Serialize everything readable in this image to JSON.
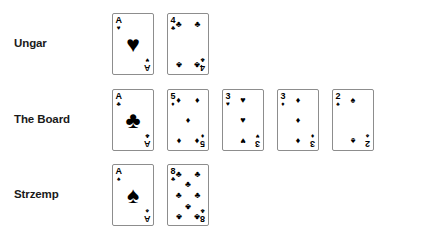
{
  "diagram": {
    "suit_glyphs": {
      "spade": "♠",
      "heart": "♥",
      "diamond": "♦",
      "club": "♣"
    },
    "card_back_color": "#ffffff",
    "card_border_color": "#8d8d8d",
    "ink_color": "#000000",
    "label_color": "#1a1a1a",
    "background_color": "#ffffff"
  },
  "rows": [
    {
      "label": "Ungar",
      "cards": [
        {
          "rank": "A",
          "suit": "heart",
          "suit_glyph": "♥",
          "name": "ace-of-hearts"
        },
        {
          "rank": "4",
          "suit": "club",
          "suit_glyph": "♣",
          "name": "four-of-clubs"
        }
      ]
    },
    {
      "label": "The Board",
      "cards": [
        {
          "rank": "A",
          "suit": "club",
          "suit_glyph": "♣",
          "name": "ace-of-clubs"
        },
        {
          "rank": "5",
          "suit": "diamond",
          "suit_glyph": "♦",
          "name": "five-of-diamonds"
        },
        {
          "rank": "3",
          "suit": "heart",
          "suit_glyph": "♥",
          "name": "three-of-hearts"
        },
        {
          "rank": "3",
          "suit": "diamond",
          "suit_glyph": "♦",
          "name": "three-of-diamonds"
        },
        {
          "rank": "2",
          "suit": "spade",
          "suit_glyph": "♠",
          "name": "two-of-spades"
        }
      ]
    },
    {
      "label": "Strzemp",
      "cards": [
        {
          "rank": "A",
          "suit": "spade",
          "suit_glyph": "♠",
          "name": "ace-of-spades"
        },
        {
          "rank": "8",
          "suit": "club",
          "suit_glyph": "♣",
          "name": "eight-of-clubs"
        }
      ]
    }
  ]
}
